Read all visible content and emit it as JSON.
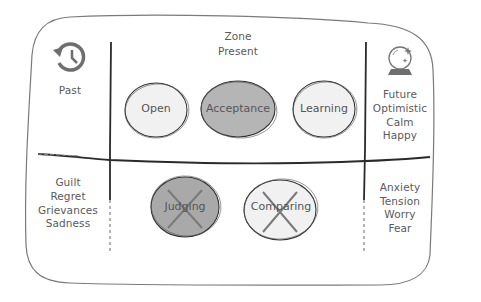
{
  "diagram": {
    "zones": {
      "present": {
        "title": "Zone",
        "subtitle": "Present"
      },
      "past": {
        "label": "Past",
        "icon": "history-icon",
        "feelings": [
          "Guilt",
          "Regret",
          "Grievances",
          "Sadness"
        ]
      },
      "future": {
        "label": "Future",
        "icon": "crystal-ball-icon",
        "feelings_top": [
          "Optimistic",
          "Calm",
          "Happy"
        ],
        "feelings_bottom": [
          "Anxiety",
          "Tension",
          "Worry",
          "Fear"
        ]
      }
    },
    "present_positive": [
      {
        "label": "Open",
        "fill": "#f1f1f1",
        "crossed": false
      },
      {
        "label": "Acceptance",
        "fill": "#b5b5b5",
        "crossed": false
      },
      {
        "label": "Learning",
        "fill": "#f1f1f1",
        "crossed": false
      }
    ],
    "present_negative": [
      {
        "label": "Judging",
        "fill": "#a9a9a9",
        "crossed": true
      },
      {
        "label": "Comparing",
        "fill": "#f1f1f1",
        "crossed": true
      }
    ],
    "colors": {
      "line": "#2a2a2a",
      "frame": "#777777",
      "icon": "#6e6e6e",
      "text": "#5a5a5a"
    }
  }
}
